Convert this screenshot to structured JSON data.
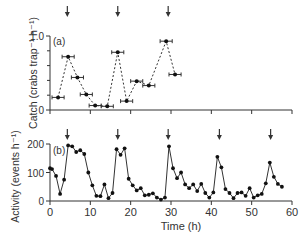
{
  "chart_data": [
    {
      "panel": "a",
      "type": "line",
      "panel_label": "(a)",
      "xlabel": "Time (h)",
      "ylabel": "Catch (crabs trap⁻¹ h⁻¹)",
      "ylim": [
        0,
        1.0
      ],
      "xlim": [
        0,
        60
      ],
      "yticks": [
        0,
        1.0
      ],
      "ytick_labels": [
        "0",
        "1.0"
      ],
      "yminor_ticks": [
        0.2,
        0.4,
        0.6,
        0.8
      ],
      "xticks": [
        0,
        10,
        20,
        30,
        40,
        50,
        60
      ],
      "line_style": "dashed",
      "error_bars": "horizontal",
      "points": [
        {
          "x": 2.0,
          "y": 0.17,
          "xerr": 1.5
        },
        {
          "x": 4.5,
          "y": 0.72,
          "xerr": 1.5
        },
        {
          "x": 6.8,
          "y": 0.44,
          "xerr": 1.5
        },
        {
          "x": 9.0,
          "y": 0.21,
          "xerr": 1.5
        },
        {
          "x": 11.2,
          "y": 0.06,
          "xerr": 1.5
        },
        {
          "x": 16.8,
          "y": 0.78,
          "xerr": 1.5
        },
        {
          "x": 14.2,
          "y": 0.05,
          "xerr": 1.5
        },
        {
          "x": 19.0,
          "y": 0.12,
          "xerr": 1.5
        },
        {
          "x": 21.5,
          "y": 0.39,
          "xerr": 1.5
        },
        {
          "x": 24.5,
          "y": 0.33,
          "xerr": 1.5
        },
        {
          "x": 28.8,
          "y": 0.93,
          "xerr": 1.5
        },
        {
          "x": 31.0,
          "y": 0.48,
          "xerr": 1.5
        }
      ],
      "arrows_x": [
        4.3,
        16.8,
        29.3
      ]
    },
    {
      "panel": "b",
      "type": "line",
      "panel_label": "(b)",
      "xlabel": "Time (h)",
      "ylabel": "Activity (events h⁻¹)",
      "ylim": [
        0,
        200
      ],
      "xlim": [
        0,
        60
      ],
      "yticks": [
        0,
        100,
        200
      ],
      "xticks": [
        0,
        10,
        20,
        30,
        40,
        50,
        60
      ],
      "line_style": "solid",
      "x": [
        0.0,
        0.5,
        1.5,
        2.5,
        3.5,
        4.5,
        5.5,
        6.5,
        7.5,
        8.5,
        9.5,
        10.5,
        11.5,
        12.5,
        13.5,
        14.5,
        15.5,
        16.5,
        17.5,
        18.5,
        19.5,
        20.5,
        21.5,
        22.5,
        23.5,
        24.5,
        25.5,
        26.5,
        27.5,
        28.5,
        29.5,
        30.5,
        31.5,
        32.5,
        33.5,
        34.5,
        35.5,
        36.5,
        37.5,
        38.5,
        39.5,
        40.5,
        41.5,
        42.5,
        43.5,
        44.5,
        45.5,
        46.5,
        47.5,
        48.5,
        49.5,
        50.5,
        51.5,
        52.5,
        53.5,
        54.5,
        55.5,
        56.5,
        57.5
      ],
      "values": [
        115,
        112,
        88,
        25,
        75,
        195,
        192,
        172,
        178,
        165,
        100,
        55,
        18,
        17,
        58,
        10,
        28,
        182,
        162,
        185,
        78,
        55,
        37,
        45,
        20,
        22,
        27,
        12,
        5,
        12,
        192,
        115,
        80,
        100,
        58,
        45,
        58,
        35,
        60,
        28,
        12,
        30,
        155,
        118,
        42,
        28,
        10,
        28,
        30,
        18,
        45,
        12,
        20,
        25,
        62,
        135,
        85,
        60,
        50
      ],
      "arrows_x": [
        4.3,
        16.8,
        29.3,
        42.0,
        54.7
      ]
    }
  ]
}
